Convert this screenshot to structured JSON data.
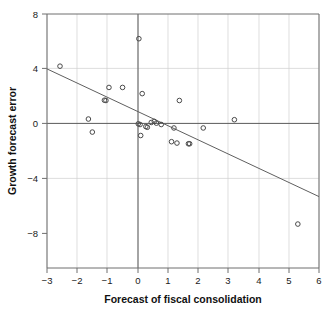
{
  "chart_data": {
    "type": "scatter",
    "title": "",
    "xlabel": "Forecast of fiscal consolidation",
    "ylabel": "Growth forecast error",
    "xlim": [
      -3,
      6
    ],
    "ylim": [
      -10.5,
      8
    ],
    "xticks": [
      -3,
      -2,
      -1,
      0,
      1,
      2,
      3,
      4,
      5,
      6
    ],
    "xtick_labels": [
      "−3",
      "−2",
      "−1",
      "0",
      "1",
      "2",
      "3",
      "4",
      "5",
      "6"
    ],
    "yticks": [
      8,
      4,
      0,
      -4,
      -8
    ],
    "ytick_labels": [
      "8",
      "4",
      "0",
      "−4",
      "−8"
    ],
    "grid": "vertical gridlines at each x tick; horizontal gridlines at y = 4 and y = -4",
    "legend": "none",
    "marker": "open circle",
    "points": [
      {
        "x": -2.57,
        "y": 4.2
      },
      {
        "x": -1.63,
        "y": 0.35
      },
      {
        "x": -1.5,
        "y": -0.6
      },
      {
        "x": -1.1,
        "y": 1.72
      },
      {
        "x": -1.05,
        "y": 1.7
      },
      {
        "x": -0.95,
        "y": 2.65
      },
      {
        "x": -0.5,
        "y": 2.65
      },
      {
        "x": 0.04,
        "y": 6.2
      },
      {
        "x": 0.15,
        "y": 2.2
      },
      {
        "x": 0.02,
        "y": 0.0
      },
      {
        "x": 0.08,
        "y": -0.05
      },
      {
        "x": 0.1,
        "y": -0.85
      },
      {
        "x": 0.27,
        "y": -0.2
      },
      {
        "x": 0.32,
        "y": -0.25
      },
      {
        "x": 0.45,
        "y": 0.1
      },
      {
        "x": 0.55,
        "y": 0.18
      },
      {
        "x": 0.62,
        "y": 0.05
      },
      {
        "x": 0.78,
        "y": -0.05
      },
      {
        "x": 1.12,
        "y": -1.3
      },
      {
        "x": 1.2,
        "y": -0.3
      },
      {
        "x": 1.3,
        "y": -1.4
      },
      {
        "x": 1.38,
        "y": 1.7
      },
      {
        "x": 1.68,
        "y": -1.45
      },
      {
        "x": 1.72,
        "y": -1.45
      },
      {
        "x": 2.17,
        "y": -0.3
      },
      {
        "x": 3.2,
        "y": 0.3
      },
      {
        "x": 5.3,
        "y": -7.3
      }
    ],
    "fit_line": {
      "description": "linear regression trend line",
      "x_start": -3,
      "y_start": 4.0,
      "x_end": 6,
      "y_end": -5.3,
      "slope": -1.033,
      "intercept": 0.9
    }
  }
}
